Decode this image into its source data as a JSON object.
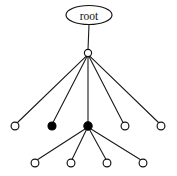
{
  "figure": {
    "kind": "tree-diagram",
    "background_color": "#ffffff",
    "stroke_color": "#111111",
    "filled_node_color": "#000000",
    "open_node_color": "#ffffff",
    "width": 177,
    "height": 176
  },
  "root": {
    "label": "root",
    "shape": "ellipse",
    "cx": 89,
    "cy": 15,
    "rx": 23,
    "ry": 9.5
  },
  "nodes": [
    {
      "id": "hub",
      "label": "",
      "style": "open",
      "cx": 88,
      "cy": 53,
      "r": 3.6,
      "level": 1
    },
    {
      "id": "n2-1",
      "label": "",
      "style": "open",
      "cx": 15,
      "cy": 126,
      "r": 3.9,
      "level": 2
    },
    {
      "id": "n2-2",
      "label": "",
      "style": "filled",
      "cx": 52,
      "cy": 126,
      "r": 4.0,
      "level": 2
    },
    {
      "id": "n2-3",
      "label": "",
      "style": "filled",
      "cx": 88,
      "cy": 126,
      "r": 4.2,
      "level": 2
    },
    {
      "id": "n2-4",
      "label": "",
      "style": "open",
      "cx": 125,
      "cy": 126,
      "r": 3.9,
      "level": 2
    },
    {
      "id": "n2-5",
      "label": "",
      "style": "open",
      "cx": 161,
      "cy": 126,
      "r": 3.9,
      "level": 2
    },
    {
      "id": "n3-1",
      "label": "",
      "style": "open",
      "cx": 35,
      "cy": 163,
      "r": 3.9,
      "level": 3
    },
    {
      "id": "n3-2",
      "label": "",
      "style": "open",
      "cx": 71,
      "cy": 163,
      "r": 3.9,
      "level": 3
    },
    {
      "id": "n3-3",
      "label": "",
      "style": "open",
      "cx": 107,
      "cy": 163,
      "r": 3.9,
      "level": 3
    },
    {
      "id": "n3-4",
      "label": "",
      "style": "open",
      "cx": 143,
      "cy": 163,
      "r": 3.9,
      "level": 3
    }
  ],
  "edges": [
    {
      "from": "root",
      "to": "hub",
      "x1": 89,
      "y1": 24.5,
      "x2": 88,
      "y2": 49.4
    },
    {
      "from": "hub",
      "to": "n2-1",
      "x1": 86,
      "y1": 56.4,
      "x2": 17,
      "y2": 123
    },
    {
      "from": "hub",
      "to": "n2-2",
      "x1": 87,
      "y1": 56.6,
      "x2": 53,
      "y2": 122.5
    },
    {
      "from": "hub",
      "to": "n2-3",
      "x1": 88,
      "y1": 56.6,
      "x2": 88,
      "y2": 122
    },
    {
      "from": "hub",
      "to": "n2-4",
      "x1": 89,
      "y1": 56.6,
      "x2": 123,
      "y2": 122.5
    },
    {
      "from": "hub",
      "to": "n2-5",
      "x1": 90,
      "y1": 56.4,
      "x2": 159,
      "y2": 123
    },
    {
      "from": "n2-3",
      "to": "n3-1",
      "x1": 85,
      "y1": 129,
      "x2": 37,
      "y2": 160
    },
    {
      "from": "n2-3",
      "to": "n3-2",
      "x1": 86.5,
      "y1": 129.5,
      "x2": 72,
      "y2": 159.5
    },
    {
      "from": "n2-3",
      "to": "n3-3",
      "x1": 89.5,
      "y1": 129.5,
      "x2": 106,
      "y2": 159.5
    },
    {
      "from": "n2-3",
      "to": "n3-4",
      "x1": 91,
      "y1": 129,
      "x2": 141,
      "y2": 160
    }
  ]
}
